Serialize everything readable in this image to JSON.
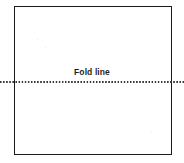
{
  "figure": {
    "kind": "technical-line-drawing",
    "sheet": {
      "name": "square sheet outline",
      "border_color": "#1a1a1a",
      "fill_color": "#ffffff"
    },
    "fold": {
      "label": "Fold line",
      "line_style": "dotted",
      "line_color": "#3a3a3a",
      "orientation": "horizontal"
    }
  }
}
